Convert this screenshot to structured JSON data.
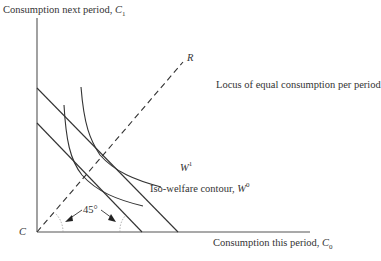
{
  "diagram": {
    "y_axis_label": "Consumption next period, ",
    "y_axis_symbol": "C",
    "y_axis_subscript": "1",
    "x_axis_label": "Consumption this period, ",
    "x_axis_symbol": "C",
    "x_axis_subscript": "0",
    "origin_label": "C",
    "ray_label": "R",
    "ray_description": "Locus of equal consumption per period",
    "upper_contour_symbol": "W",
    "upper_contour_superscript": "1",
    "lower_contour_text": "Iso-welfare contour, ",
    "lower_contour_symbol": "W",
    "lower_contour_superscript": "0",
    "angle_label": "45°"
  },
  "colors": {
    "line": "#333333",
    "text": "#333333",
    "arc": "#999999"
  }
}
